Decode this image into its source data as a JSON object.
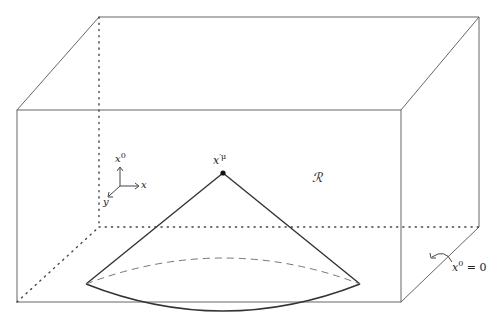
{
  "figure": {
    "type": "3D box with light cone diagram",
    "region_label": "ℛ",
    "apex_label": "x",
    "apex_label_sup": "′μ",
    "axes": {
      "vertical": "x",
      "vertical_sup": "0",
      "horizontal": "x",
      "depth": "y"
    },
    "surface_label": "x",
    "surface_label_sup": "0",
    "surface_label_eq": " = 0",
    "colors": {
      "line": "#555555",
      "cone": "#333333",
      "dashed": "#777777",
      "background": "#ffffff"
    }
  }
}
